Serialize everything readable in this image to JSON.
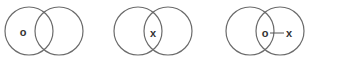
{
  "panels": [
    {
      "name": "panel-1",
      "circles": [
        {
          "cx": 29,
          "cy": 31,
          "r": 24
        },
        {
          "cx": 59,
          "cy": 31,
          "r": 24
        }
      ],
      "labels": [
        {
          "text": "o",
          "x": 23,
          "y": 31
        }
      ]
    },
    {
      "name": "panel-2",
      "circles": [
        {
          "cx": 138,
          "cy": 31,
          "r": 24
        },
        {
          "cx": 168,
          "cy": 31,
          "r": 24
        }
      ],
      "labels": [
        {
          "text": "x",
          "x": 153,
          "y": 33
        }
      ]
    },
    {
      "name": "panel-3",
      "circles": [
        {
          "cx": 250,
          "cy": 31,
          "r": 24
        },
        {
          "cx": 280,
          "cy": 31,
          "r": 24
        }
      ],
      "labels": [
        {
          "text": "o",
          "x": 265,
          "y": 33
        },
        {
          "text": "x",
          "x": 290,
          "y": 33
        }
      ],
      "link": {
        "x1": 269,
        "y1": 33,
        "x2": 285,
        "y2": 33
      }
    }
  ],
  "colors": {
    "stroke": "#6b6b6b",
    "text": "#333333",
    "background": "#ffffff"
  }
}
